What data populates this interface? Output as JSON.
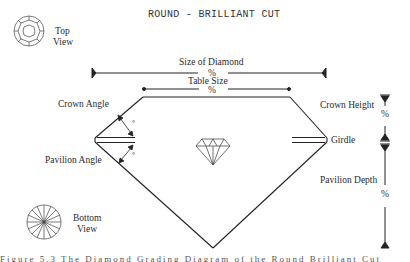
{
  "title": "ROUND - BRILLIANT CUT",
  "views": {
    "top": {
      "line1": "Top",
      "line2": "View"
    },
    "bottom": {
      "line1": "Bottom",
      "line2": "View"
    }
  },
  "dimensions": {
    "size_of_diamond": {
      "label": "Size of Diamond",
      "value": "%"
    },
    "table_size": {
      "label": "Table Size",
      "value": "%"
    },
    "crown_height": {
      "label": "Crown Height",
      "value": "%"
    },
    "pavilion_depth": {
      "label": "Pavilion Depth",
      "value": "%"
    }
  },
  "angles": {
    "crown": {
      "label": "Crown Angle",
      "value": "°"
    },
    "pavilion": {
      "label": "Pavilion Angle",
      "value": "°"
    }
  },
  "girdle": {
    "label": "Girdle"
  },
  "footer_text": "Figure 5.3 The Diamond Grading Diagram of the Round Brilliant Cut"
}
